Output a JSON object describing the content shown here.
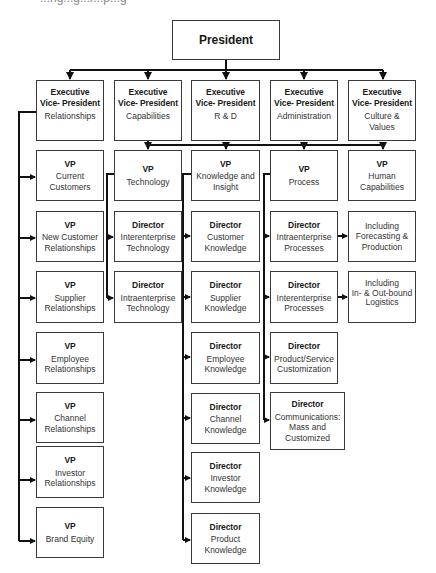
{
  "caption_clipped": "...ng...g...r...p...g",
  "president": {
    "role": "President"
  },
  "executives": [
    {
      "role": "Executive\nVice- President",
      "dept": "Relationships"
    },
    {
      "role": "Executive\nVice- President",
      "dept": "Capabilities"
    },
    {
      "role": "Executive\nVice- President",
      "dept": "R & D"
    },
    {
      "role": "Executive\nVice- President",
      "dept": "Administration"
    },
    {
      "role": "Executive\nVice- President",
      "dept": "Culture &\nValues"
    }
  ],
  "relationships_column": [
    {
      "role": "VP",
      "dept": "Current\nCustomers"
    },
    {
      "role": "VP",
      "dept": "New Customer\nRelationships"
    },
    {
      "role": "VP",
      "dept": "Supplier\nRelationships"
    },
    {
      "role": "VP",
      "dept": "Employee\nRelationships"
    },
    {
      "role": "VP",
      "dept": "Channel\nRelationships"
    },
    {
      "role": "VP",
      "dept": "Investor\nRelationships"
    },
    {
      "role": "VP",
      "dept": "Brand Equity"
    }
  ],
  "technology_column": [
    {
      "role": "VP",
      "dept": "Technology"
    },
    {
      "role": "Director",
      "dept": "Interenterprise\nTechnology"
    },
    {
      "role": "Director",
      "dept": "Intraenterprise\nTechnology"
    }
  ],
  "knowledge_column": [
    {
      "role": "VP",
      "dept": "Knowledge and\nInsight"
    },
    {
      "role": "Director",
      "dept": "Customer\nKnowledge"
    },
    {
      "role": "Director",
      "dept": "Supplier\nKnowledge"
    },
    {
      "role": "Director",
      "dept": "Employee\nKnowledge"
    },
    {
      "role": "Director",
      "dept": "Channel\nKnowledge"
    },
    {
      "role": "Director",
      "dept": "Investor\nKnowledge"
    },
    {
      "role": "Director",
      "dept": "Product\nKnowledge"
    }
  ],
  "process_column": [
    {
      "role": "VP",
      "dept": "Process"
    },
    {
      "role": "Director",
      "dept": "Intraenterprise\nProcesses"
    },
    {
      "role": "Director",
      "dept": "Interenterprise\nProcesses"
    },
    {
      "role": "Director",
      "dept": "Product/Service\nCustomization"
    },
    {
      "role": "Director",
      "dept": "Communications:\nMass and\nCustomized"
    }
  ],
  "human_capabilities_column": [
    {
      "role": "VP",
      "dept": "Human\nCapabilities"
    },
    {
      "role": "",
      "dept": "Including\nForecasting &\nProduction"
    },
    {
      "role": "",
      "dept": "Including\nIn- & Out-bound\nLogistics"
    }
  ],
  "colors": {
    "line": "#111111",
    "border": "#3a3a3a",
    "background": "#ffffff"
  }
}
